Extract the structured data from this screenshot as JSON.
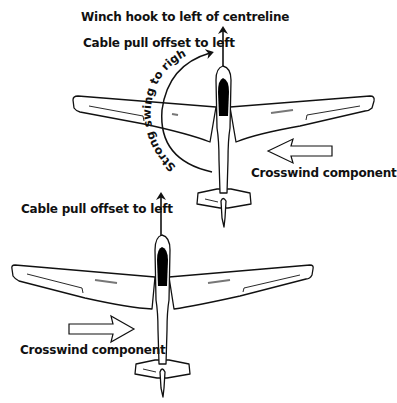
{
  "diagram": {
    "top_scenario": {
      "labels": {
        "winch_hook": "Winch hook to left of centreline",
        "cable_pull": "Cable pull offset to left",
        "swing": "Strong swing to right",
        "crosswind": "Crosswind component"
      },
      "crosswind_direction": "from right (arrow points left)"
    },
    "bottom_scenario": {
      "labels": {
        "cable_pull": "Cable pull offset to left",
        "crosswind": "Crosswind component"
      },
      "crosswind_direction": "from left (arrow points right)"
    },
    "colors": {
      "line": "#111111",
      "canopy": "#000000",
      "background": "#ffffff"
    }
  }
}
